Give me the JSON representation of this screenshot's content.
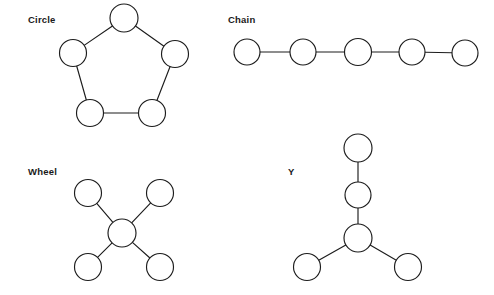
{
  "figure": {
    "background_color": "#ffffff",
    "stroke_color": "#1c1c1c",
    "node_fill_color": "#ffffff",
    "label_color": "#1a1a1a",
    "width": 494,
    "height": 295
  },
  "diagrams": [
    {
      "id": "circle",
      "label": "Circle",
      "label_pos": {
        "x": 28,
        "y": 23
      },
      "nodes": [
        {
          "id": "c1",
          "cx": 124,
          "cy": 18,
          "r": 14
        },
        {
          "id": "c2",
          "cx": 175,
          "cy": 54,
          "r": 13.5
        },
        {
          "id": "c3",
          "cx": 152,
          "cy": 113,
          "r": 13.5
        },
        {
          "id": "c4",
          "cx": 90,
          "cy": 113,
          "r": 13.5
        },
        {
          "id": "c5",
          "cx": 73,
          "cy": 53,
          "r": 13.5
        }
      ],
      "edges": [
        {
          "from": "c1",
          "to": "c2"
        },
        {
          "from": "c2",
          "to": "c3"
        },
        {
          "from": "c3",
          "to": "c4"
        },
        {
          "from": "c4",
          "to": "c5"
        },
        {
          "from": "c5",
          "to": "c1"
        }
      ]
    },
    {
      "id": "chain",
      "label": "Chain",
      "label_pos": {
        "x": 228,
        "y": 23
      },
      "nodes": [
        {
          "id": "h1",
          "cx": 247,
          "cy": 52,
          "r": 13
        },
        {
          "id": "h2",
          "cx": 303,
          "cy": 52,
          "r": 13
        },
        {
          "id": "h3",
          "cx": 358,
          "cy": 52,
          "r": 13.5
        },
        {
          "id": "h4",
          "cx": 412,
          "cy": 52,
          "r": 13
        },
        {
          "id": "h5",
          "cx": 465,
          "cy": 53,
          "r": 13
        }
      ],
      "edges": [
        {
          "from": "h1",
          "to": "h2"
        },
        {
          "from": "h2",
          "to": "h3"
        },
        {
          "from": "h3",
          "to": "h4"
        },
        {
          "from": "h4",
          "to": "h5"
        }
      ]
    },
    {
      "id": "wheel",
      "label": "Wheel",
      "label_pos": {
        "x": 28,
        "y": 175
      },
      "nodes": [
        {
          "id": "w0",
          "cx": 122,
          "cy": 233,
          "r": 14
        },
        {
          "id": "w1",
          "cx": 88,
          "cy": 193,
          "r": 13.5
        },
        {
          "id": "w2",
          "cx": 160,
          "cy": 193,
          "r": 13.5
        },
        {
          "id": "w3",
          "cx": 88,
          "cy": 267,
          "r": 13.5
        },
        {
          "id": "w4",
          "cx": 160,
          "cy": 267,
          "r": 13.5
        }
      ],
      "edges": [
        {
          "from": "w0",
          "to": "w1"
        },
        {
          "from": "w0",
          "to": "w2"
        },
        {
          "from": "w0",
          "to": "w3"
        },
        {
          "from": "w0",
          "to": "w4"
        }
      ]
    },
    {
      "id": "y",
      "label": "Y",
      "label_pos": {
        "x": 288,
        "y": 175
      },
      "nodes": [
        {
          "id": "y1",
          "cx": 358,
          "cy": 148,
          "r": 14
        },
        {
          "id": "y2",
          "cx": 358,
          "cy": 195,
          "r": 13
        },
        {
          "id": "y3",
          "cx": 358,
          "cy": 238,
          "r": 14
        },
        {
          "id": "y4",
          "cx": 307,
          "cy": 267,
          "r": 13.5
        },
        {
          "id": "y5",
          "cx": 408,
          "cy": 267,
          "r": 13.5
        }
      ],
      "edges": [
        {
          "from": "y1",
          "to": "y2"
        },
        {
          "from": "y2",
          "to": "y3"
        },
        {
          "from": "y3",
          "to": "y4"
        },
        {
          "from": "y3",
          "to": "y5"
        }
      ]
    }
  ]
}
